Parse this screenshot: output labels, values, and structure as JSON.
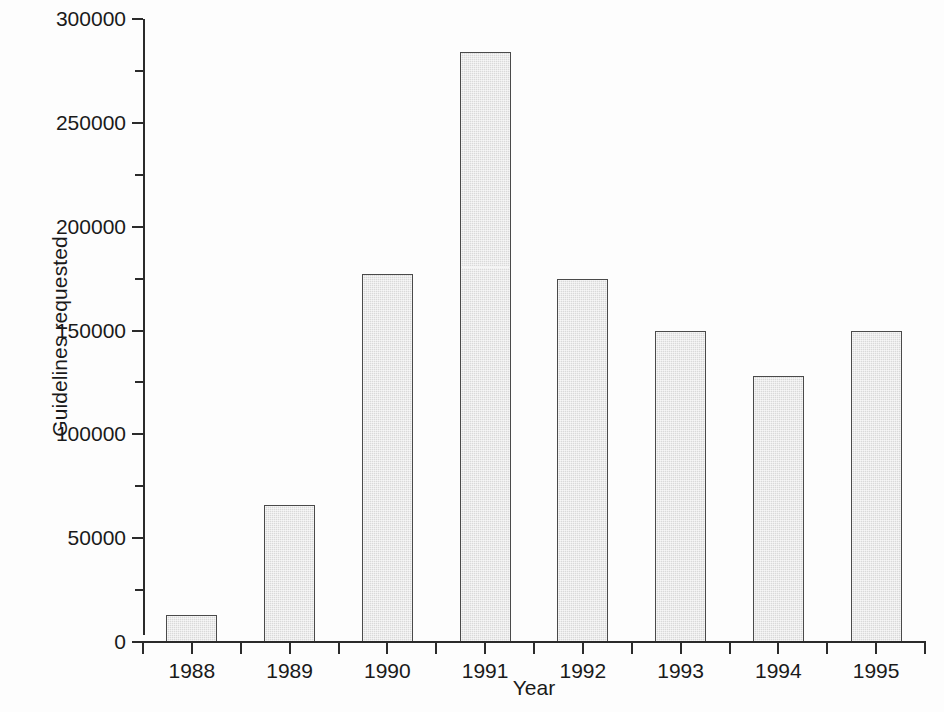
{
  "figure": {
    "background_color": "#fdfdfd",
    "axis_color": "#2b2b2b",
    "bar_fill_color": "#d9d9d9",
    "bar_edge_color": "#4a4a4a"
  },
  "chart_data": {
    "type": "bar",
    "title": "",
    "xlabel": "Year",
    "ylabel": "Guidelines requested",
    "categories": [
      "1988",
      "1989",
      "1990",
      "1991",
      "1992",
      "1993",
      "1994",
      "1995"
    ],
    "values": [
      13000,
      66000,
      177000,
      284000,
      175000,
      150000,
      128000,
      150000
    ],
    "ylim": [
      0,
      300000
    ],
    "xlim_note": "categorical",
    "y_major_ticks": [
      0,
      50000,
      100000,
      150000,
      200000,
      250000,
      300000
    ],
    "y_major_tick_labels": [
      "0",
      "50000",
      "100000",
      "150000",
      "200000",
      "250000",
      "300000"
    ],
    "y_minor_ticks": [
      25000,
      75000,
      125000,
      175000,
      225000,
      275000
    ],
    "grid": false,
    "legend": null,
    "legend_position": "none",
    "series": [
      {
        "name": "Guidelines requested",
        "values": [
          13000,
          66000,
          177000,
          284000,
          175000,
          150000,
          128000,
          150000
        ]
      }
    ]
  }
}
